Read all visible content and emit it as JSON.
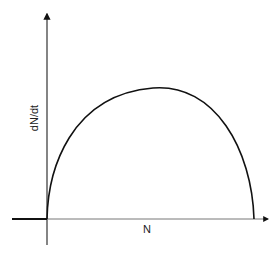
{
  "diagram": {
    "type": "population growth rate vs population (dN/dt vs N)",
    "x_axis_label": "N",
    "y_axis_label": "dN/dt",
    "curve": "concave-down arc starting at origin, peaking near middle, returning to zero",
    "colors": {
      "stroke": "#111111",
      "axis": "#333333",
      "background": "#ffffff"
    }
  }
}
